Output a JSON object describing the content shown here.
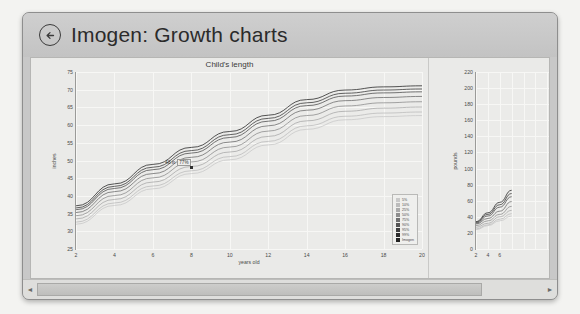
{
  "window": {
    "title": "Imogen: Growth charts",
    "back_icon": "back-arrow-icon"
  },
  "scrollbar": {
    "left_arrow": "◄",
    "right_arrow": "►"
  },
  "chart_data": [
    {
      "type": "line",
      "title": "Child's length",
      "xlabel": "years old",
      "ylabel": "inches",
      "xlim": [
        2,
        20
      ],
      "ylim": [
        25,
        75
      ],
      "xticks": [
        2,
        4,
        6,
        8,
        10,
        12,
        14,
        16,
        18,
        20
      ],
      "yticks": [
        25,
        30,
        35,
        40,
        45,
        50,
        55,
        60,
        65,
        70,
        75
      ],
      "grid": true,
      "legend_position": "bottom-right",
      "x": [
        2,
        4,
        6,
        8,
        10,
        12,
        14,
        16,
        18,
        20
      ],
      "series": [
        {
          "name": "5%",
          "color": "#c9c9c9",
          "values": [
            32.0,
            37.3,
            42.0,
            46.3,
            50.2,
            54.4,
            58.8,
            61.5,
            62.4,
            62.7
          ]
        },
        {
          "name": "10%",
          "color": "#bcbcbc",
          "values": [
            32.6,
            38.0,
            42.8,
            47.1,
            51.1,
            55.4,
            59.8,
            62.5,
            63.4,
            63.7
          ]
        },
        {
          "name": "25%",
          "color": "#aaaaaa",
          "values": [
            33.5,
            39.0,
            43.9,
            48.3,
            52.4,
            56.8,
            61.2,
            63.9,
            64.8,
            65.1
          ]
        },
        {
          "name": "50%",
          "color": "#8e8e8e",
          "values": [
            34.4,
            40.1,
            45.1,
            49.6,
            53.8,
            58.3,
            62.7,
            65.4,
            66.3,
            66.6
          ]
        },
        {
          "name": "75%",
          "color": "#6f6f6f",
          "values": [
            35.3,
            41.2,
            46.3,
            50.9,
            55.2,
            59.8,
            64.2,
            66.9,
            67.8,
            68.1
          ]
        },
        {
          "name": "90%",
          "color": "#545454",
          "values": [
            36.1,
            42.1,
            47.4,
            52.1,
            56.5,
            61.1,
            65.5,
            68.2,
            69.1,
            69.4
          ]
        },
        {
          "name": "95%",
          "color": "#3d3d3d",
          "values": [
            36.6,
            42.7,
            48.1,
            52.8,
            57.3,
            61.9,
            66.3,
            69.0,
            69.9,
            70.2
          ]
        },
        {
          "name": "99%",
          "color": "#2b2b2b",
          "values": [
            37.2,
            43.4,
            48.9,
            53.7,
            58.2,
            62.8,
            67.2,
            69.9,
            70.8,
            71.1
          ]
        },
        {
          "name": "Imogen",
          "color": "#222222",
          "values": [
            null,
            null,
            null,
            48.0,
            null,
            null,
            null,
            null,
            null,
            null
          ]
        }
      ],
      "annotation": {
        "value": "48 in",
        "percentile": "77%",
        "at_x": 8,
        "at_y": 48
      },
      "legend_entries": [
        {
          "label": "5%",
          "color": "#c9c9c9"
        },
        {
          "label": "10%",
          "color": "#bcbcbc"
        },
        {
          "label": "25%",
          "color": "#aaaaaa"
        },
        {
          "label": "50%",
          "color": "#8e8e8e"
        },
        {
          "label": "75%",
          "color": "#6f6f6f"
        },
        {
          "label": "90%",
          "color": "#545454"
        },
        {
          "label": "95%",
          "color": "#3d3d3d"
        },
        {
          "label": "99%",
          "color": "#2b2b2b"
        },
        {
          "label": "Imogen",
          "color": "#222222"
        }
      ]
    },
    {
      "type": "line",
      "title": "Child's weight",
      "xlabel": "years old",
      "ylabel": "pounds",
      "xlim": [
        2,
        20
      ],
      "ylim": [
        0,
        220
      ],
      "xticks": [
        2,
        4,
        6
      ],
      "yticks": [
        0,
        20,
        40,
        60,
        80,
        100,
        120,
        140,
        160,
        180,
        200,
        220
      ],
      "grid": true,
      "legend_position": "none",
      "x": [
        2,
        4,
        6,
        8
      ],
      "series": [
        {
          "name": "5%",
          "color": "#c9c9c9",
          "values": [
            24,
            29,
            35,
            41
          ]
        },
        {
          "name": "10%",
          "color": "#bcbcbc",
          "values": [
            25,
            30,
            37,
            44
          ]
        },
        {
          "name": "25%",
          "color": "#aaaaaa",
          "values": [
            27,
            32,
            40,
            48
          ]
        },
        {
          "name": "50%",
          "color": "#8e8e8e",
          "values": [
            29,
            35,
            43,
            53
          ]
        },
        {
          "name": "75%",
          "color": "#6f6f6f",
          "values": [
            31,
            38,
            47,
            59
          ]
        },
        {
          "name": "90%",
          "color": "#545454",
          "values": [
            32,
            41,
            52,
            65
          ]
        },
        {
          "name": "95%",
          "color": "#3d3d3d",
          "values": [
            33,
            43,
            55,
            69
          ]
        },
        {
          "name": "99%",
          "color": "#2b2b2b",
          "values": [
            34,
            45,
            58,
            73
          ]
        }
      ]
    }
  ]
}
